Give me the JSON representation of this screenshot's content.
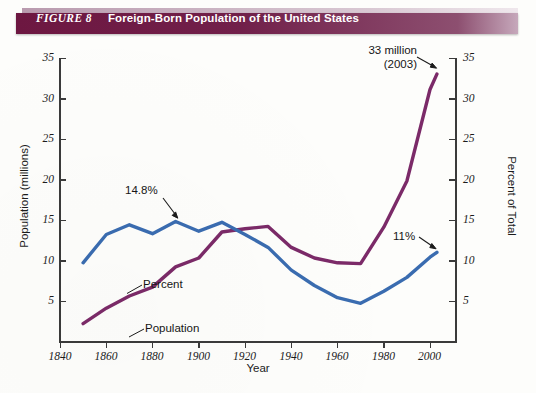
{
  "header": {
    "figure_label": "FIGURE 8",
    "title": "Foreign-Born Population of the United States",
    "bar_color": "#6d1741"
  },
  "axes": {
    "left_title": "Population (millions)",
    "right_title": "Percent of Total",
    "x_title": "Year",
    "y_ticks": [
      "5",
      "10",
      "15",
      "20",
      "25",
      "30",
      "35"
    ],
    "x_ticks": [
      "1840",
      "1860",
      "1880",
      "1900",
      "1920",
      "1940",
      "1960",
      "1980",
      "2000"
    ]
  },
  "annotations": {
    "peak_percent": "14.8%",
    "end_population_line1": "33 million",
    "end_population_line2": "(2003)",
    "end_percent": "11%",
    "series_label_percent": "Percent",
    "series_label_population": "Population"
  },
  "chart_data": {
    "type": "line",
    "title": "Foreign-Born Population of the United States",
    "xlabel": "Year",
    "ylabel": "Population (millions)",
    "y2label": "Percent of Total",
    "xlim": [
      1840,
      2010
    ],
    "ylim": [
      0,
      35
    ],
    "y2lim": [
      0,
      35
    ],
    "grid": false,
    "legend": "inline-labels",
    "x": [
      1850,
      1860,
      1870,
      1880,
      1890,
      1900,
      1910,
      1920,
      1930,
      1940,
      1950,
      1960,
      1970,
      1980,
      1990,
      2000,
      2003
    ],
    "series": [
      {
        "name": "Population",
        "color": "#7b2a68",
        "axis": "left",
        "unit": "millions",
        "values": [
          2.2,
          4.1,
          5.6,
          6.7,
          9.2,
          10.3,
          13.5,
          13.9,
          14.2,
          11.6,
          10.3,
          9.7,
          9.6,
          14.1,
          19.8,
          31.1,
          33.0
        ]
      },
      {
        "name": "Percent",
        "color": "#3a6cb0",
        "axis": "right",
        "unit": "percent of total",
        "values": [
          9.7,
          13.2,
          14.4,
          13.3,
          14.8,
          13.6,
          14.7,
          13.2,
          11.6,
          8.8,
          6.9,
          5.4,
          4.7,
          6.2,
          7.9,
          10.4,
          11.0
        ]
      }
    ],
    "annotations": [
      {
        "text": "14.8%",
        "series": "Percent",
        "x": 1890,
        "y": 14.8
      },
      {
        "text": "33 million (2003)",
        "series": "Population",
        "x": 2003,
        "y": 33.0
      },
      {
        "text": "11%",
        "series": "Percent",
        "x": 2003,
        "y": 11.0
      }
    ]
  }
}
